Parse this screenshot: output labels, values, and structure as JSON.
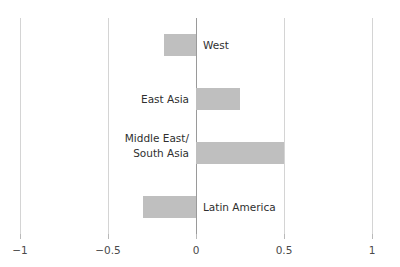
{
  "chart_data": {
    "type": "bar",
    "orientation": "horizontal",
    "title": "",
    "xlabel": "",
    "ylabel": "",
    "xlim": [
      -1,
      1
    ],
    "xticks": [
      -1,
      -0.5,
      0,
      0.5,
      1
    ],
    "xticklabels": [
      "−1",
      "−0.5",
      "0",
      "0.5",
      "1"
    ],
    "grid": true,
    "legend": false,
    "bar_color": "#bfbfbf",
    "zero_line_color": "#9a9a9a",
    "gridline_color": "#d4d4d4",
    "categories": [
      "West",
      "East Asia",
      "Middle East/\nSouth Asia",
      "Latin America"
    ],
    "values": [
      -0.18,
      0.25,
      0.5,
      -0.3
    ],
    "bars": [
      {
        "label": "West",
        "value": -0.18,
        "label_side": "right",
        "two_line": false
      },
      {
        "label": "East Asia",
        "value": 0.25,
        "label_side": "left",
        "two_line": false
      },
      {
        "label": "Middle East/\nSouth Asia",
        "value": 0.5,
        "label_side": "left",
        "two_line": true
      },
      {
        "label": "Latin America",
        "value": -0.3,
        "label_side": "right",
        "two_line": false
      }
    ]
  }
}
